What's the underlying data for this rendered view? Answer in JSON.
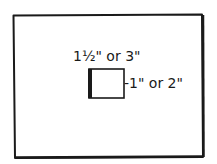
{
  "diagram": {
    "label_width_text": "1½\" or 3\"",
    "label_height_text": "-1\" or 2\"",
    "colors": {
      "ink": "#1a1a1a",
      "background": "#ffffff"
    }
  }
}
